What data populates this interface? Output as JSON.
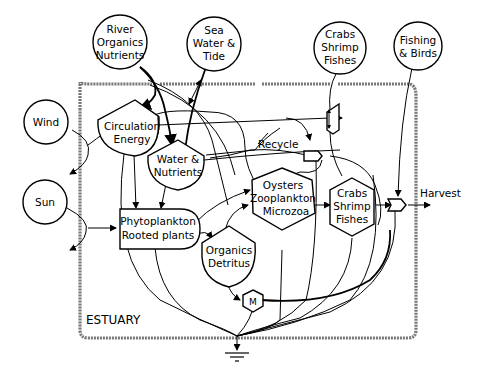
{
  "diagram": {
    "boundary_label": "ESTUARY",
    "sources": {
      "river": [
        "River",
        "Organics",
        "Nutrients"
      ],
      "sea": [
        "Sea",
        "Water &",
        "Tide"
      ],
      "crabs_ext": [
        "Crabs",
        "Shrimp",
        "Fishes"
      ],
      "fishing": [
        "Fishing",
        "& Birds"
      ],
      "wind": "Wind",
      "sun": "Sun"
    },
    "storages": {
      "circulation": [
        "Circulation",
        "Energy"
      ],
      "water_nutrients": [
        "Water &",
        "Nutrients"
      ],
      "organics_detritus": [
        "Organics",
        "Detritus"
      ]
    },
    "producers": {
      "phytoplankton": [
        "Phytoplankton",
        "Rooted plants"
      ]
    },
    "consumers": {
      "oysters": [
        "Oysters",
        "Zooplankton",
        "Microzoa"
      ],
      "crabs_int": [
        "Crabs",
        "Shrimp",
        "Fishes"
      ],
      "microbes": "M"
    },
    "labels": {
      "recycle": "Recycle",
      "harvest": "Harvest"
    },
    "colors": {
      "line": "#000000",
      "boundary": "#777777",
      "background": "#ffffff"
    }
  }
}
